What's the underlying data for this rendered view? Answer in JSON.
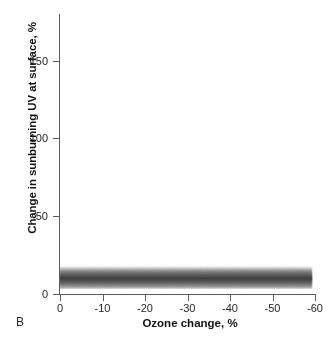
{
  "panel": {
    "label": "B"
  },
  "chart_data": {
    "type": "area",
    "title": "",
    "xlabel": "Ozone change, %",
    "ylabel": "Change in sunburning UV at surface, %",
    "xlim": [
      0,
      -60
    ],
    "ylim": [
      0,
      180
    ],
    "x_ticks": [
      "0",
      "-10",
      "-20",
      "-30",
      "-40",
      "-50",
      "-60"
    ],
    "x_tick_values": [
      0,
      -10,
      -20,
      -30,
      -40,
      -50,
      -60
    ],
    "y_ticks": [
      "0",
      "50",
      "100",
      "150"
    ],
    "y_tick_values": [
      0,
      50,
      100,
      150
    ],
    "grid": false,
    "legend": null,
    "band_color": "#4a4a4a",
    "series": [
      {
        "name": "Change in sunburning UV at surface",
        "x": [
          0,
          -5,
          -10,
          -15,
          -20,
          -25,
          -30,
          -35,
          -40,
          -45,
          -50,
          -55,
          -59
        ],
        "center": [
          10,
          13,
          17,
          22,
          28,
          36,
          46,
          58,
          73,
          91,
          112,
          138,
          163
        ],
        "lower": [
          3,
          5,
          8,
          12,
          17,
          24,
          32,
          43,
          56,
          72,
          91,
          115,
          140
        ],
        "upper": [
          18,
          22,
          27,
          33,
          40,
          49,
          60,
          74,
          91,
          111,
          134,
          161,
          180
        ]
      }
    ]
  }
}
